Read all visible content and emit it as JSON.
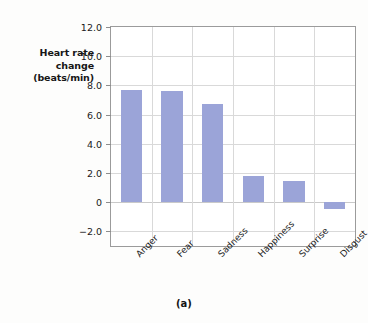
{
  "figure": {
    "caption": "(a)",
    "ylabel_lines": [
      "Heart rate",
      "change",
      "(beats/min)"
    ]
  },
  "chart_data": {
    "type": "bar",
    "title": "",
    "xlabel": "",
    "ylabel": "Heart rate change (beats/min)",
    "categories": [
      "Anger",
      "Fear",
      "Sadness",
      "Happiness",
      "Surprise",
      "Disgust"
    ],
    "values": [
      7.7,
      7.65,
      6.7,
      1.8,
      1.45,
      -0.45
    ],
    "ylim": [
      -3.0,
      12.0
    ],
    "yticks": [
      12.0,
      10.0,
      8.0,
      6.0,
      4.0,
      2.0,
      0,
      -2.0
    ],
    "ytick_labels": [
      "12.0",
      "10.0",
      "8.0",
      "6.0",
      "4.0",
      "2.0",
      "0",
      "−2.0"
    ],
    "grid": true,
    "legend": "none",
    "bar_color": "#9ba4d8",
    "frame_color": "#9b9b9b",
    "grid_color": "#d9d9d9"
  }
}
